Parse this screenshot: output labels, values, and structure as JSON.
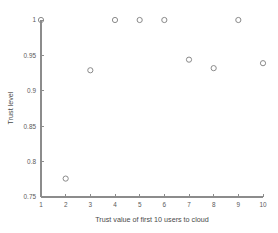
{
  "chart_data": {
    "type": "scatter",
    "title": "",
    "xlabel": "Trust value of first 10 users to cloud",
    "ylabel": "Trust level",
    "x": [
      1,
      2,
      3,
      4,
      5,
      6,
      7,
      8,
      9,
      10
    ],
    "y": [
      1.0,
      0.776,
      0.929,
      1.0,
      1.0,
      1.0,
      0.944,
      0.932,
      1.0,
      0.939
    ],
    "xlim": [
      1,
      10
    ],
    "ylim": [
      0.75,
      1.0
    ],
    "xticks": [
      1,
      2,
      3,
      4,
      5,
      6,
      7,
      8,
      9,
      10
    ],
    "xticklabels": [
      "1",
      "2",
      "3",
      "4",
      "5",
      "6",
      "7",
      "8",
      "9",
      "10"
    ],
    "yticks": [
      0.75,
      0.8,
      0.85,
      0.9,
      0.95,
      1.0
    ],
    "yticklabels": [
      "0.75",
      "0.8",
      "0.85",
      "0.9",
      "0.95",
      "1"
    ],
    "grid": false,
    "legend": null,
    "marker": "open-circle",
    "marker_color": "#8a8a8a",
    "axis_color": "#8c8c8c",
    "background": "#ffffff"
  }
}
